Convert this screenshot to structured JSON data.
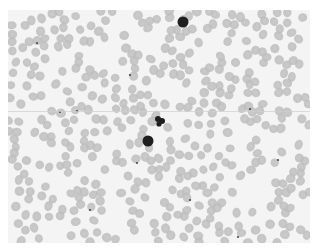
{
  "image": {
    "subject": "Peripheral blood smear micrograph (grayscale)",
    "colors": {
      "background": "#f4f4f4",
      "rbc_fill": "#bdbdbd",
      "rbc_center": "#cbcbcb",
      "leukocyte": "#1e1e1e",
      "platelet": "#4a4a4a",
      "border": "#ffffff"
    },
    "features": {
      "leukocytes": [
        {
          "label": "lymphocyte-top-right",
          "cx": 183,
          "cy": 22,
          "r": 5.5
        },
        {
          "label": "segmented-neutrophil-center",
          "cx": 160,
          "cy": 121,
          "r": 5
        },
        {
          "label": "lymphocyte-center",
          "cx": 148,
          "cy": 141,
          "r": 5.5
        }
      ],
      "platelets": [
        {
          "cx": 37,
          "cy": 43
        },
        {
          "cx": 130,
          "cy": 75
        },
        {
          "cx": 77,
          "cy": 111
        },
        {
          "cx": 250,
          "cy": 109
        },
        {
          "cx": 60,
          "cy": 112
        },
        {
          "cx": 278,
          "cy": 160
        },
        {
          "cx": 137,
          "cy": 163
        },
        {
          "cx": 190,
          "cy": 200
        },
        {
          "cx": 90,
          "cy": 210
        },
        {
          "cx": 238,
          "cy": 237
        }
      ]
    }
  }
}
